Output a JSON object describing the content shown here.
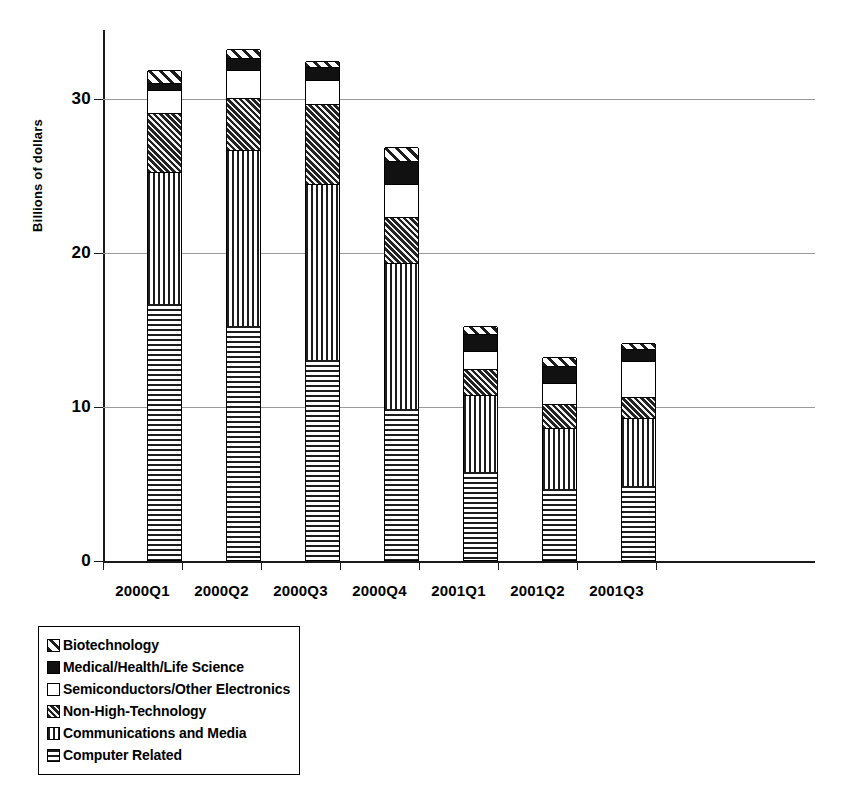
{
  "chart_data": {
    "type": "bar",
    "subtype": "stacked-bar",
    "title": "",
    "xlabel": "",
    "ylabel": "Billions of dollars",
    "ylim": [
      0,
      35
    ],
    "yticks": [
      0,
      10,
      20,
      30
    ],
    "ytick_labels": [
      "0",
      "10",
      "20",
      "30"
    ],
    "grid": true,
    "grid_axis": "y",
    "legend_position": "below-left",
    "categories": [
      "2000Q1",
      "2000Q2",
      "2000Q3",
      "2000Q4",
      "2001Q1",
      "2001Q2",
      "2001Q3"
    ],
    "stack_order_bottom_to_top": [
      "Computer Related",
      "Communications and Media",
      "Non-High-Technology",
      "Semiconductors/Other Electronics",
      "Medical/Health/Life Science",
      "Biotechnology"
    ],
    "series": [
      {
        "name": "Computer Related",
        "pattern": "horizontal-lines",
        "values": [
          16.6,
          15.2,
          13.0,
          9.8,
          5.7,
          4.6,
          4.8
        ]
      },
      {
        "name": "Communications and Media",
        "pattern": "vertical-lines",
        "values": [
          8.6,
          11.4,
          11.4,
          9.5,
          5.0,
          4.0,
          4.4
        ]
      },
      {
        "name": "Non-High-Technology",
        "pattern": "dark-diagonal",
        "values": [
          3.8,
          3.4,
          5.2,
          3.0,
          1.7,
          1.5,
          1.4
        ]
      },
      {
        "name": "Semiconductors/Other Electronics",
        "pattern": "solid-white",
        "values": [
          1.5,
          1.8,
          1.6,
          2.1,
          1.2,
          1.4,
          2.3
        ]
      },
      {
        "name": "Medical/Health/Life Science",
        "pattern": "solid-black",
        "values": [
          0.5,
          0.8,
          0.8,
          1.5,
          1.1,
          1.1,
          0.8
        ]
      },
      {
        "name": "Biotechnology",
        "pattern": "light-diagonal",
        "values": [
          0.8,
          0.6,
          0.4,
          0.9,
          0.5,
          0.6,
          0.4
        ]
      }
    ],
    "totals": [
      31.8,
      33.2,
      32.4,
      26.8,
      15.2,
      13.2,
      14.1
    ]
  },
  "axis": {
    "y_title": "Billions of dollars",
    "y_tick_labels": [
      "30",
      "20",
      "10",
      "0"
    ]
  },
  "legend": {
    "items": [
      {
        "label": "Biotechnology",
        "pattern": "light-diagonal"
      },
      {
        "label": "Medical/Health/Life Science",
        "pattern": "solid-black"
      },
      {
        "label": "Semiconductors/Other Electronics",
        "pattern": "solid-white"
      },
      {
        "label": "Non-High-Technology",
        "pattern": "dark-diagonal"
      },
      {
        "label": "Communications and Media",
        "pattern": "vertical-lines"
      },
      {
        "label": "Computer Related",
        "pattern": "horizontal-lines"
      }
    ]
  },
  "colors": {
    "ink": "#111111",
    "gridline": "#9a9a9a",
    "background": "#ffffff"
  }
}
